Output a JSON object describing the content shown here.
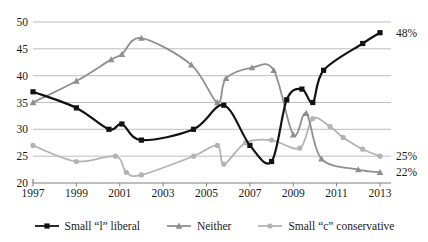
{
  "chart_data": {
    "type": "line",
    "title": "",
    "grid": true,
    "legend_position": "bottom",
    "background": "#ffffff",
    "text_color": "#1a1a1a",
    "grid_color": "#bdbdbd",
    "axis_color": "#7f7f7f",
    "x_axis": {
      "range": [
        1997,
        2013.5
      ],
      "ticks": [
        1997,
        1999,
        2001,
        2003,
        2005,
        2007,
        2009,
        2011,
        2013
      ]
    },
    "y_axis": {
      "range": [
        20,
        50
      ],
      "ticks": [
        20,
        25,
        30,
        35,
        40,
        45,
        50
      ]
    },
    "series": [
      {
        "name": "Small “c” conservative",
        "marker": "circle",
        "color": "#b3b3b3",
        "end_label": "25%",
        "points": [
          [
            1997,
            27
          ],
          [
            1999,
            24
          ],
          [
            2000.8,
            25
          ],
          [
            2001.3,
            22
          ],
          [
            2002,
            21.5
          ],
          [
            2004.4,
            25
          ],
          [
            2005.5,
            27
          ],
          [
            2005.8,
            23.5
          ],
          [
            2006.8,
            27.5
          ],
          [
            2008,
            28
          ],
          [
            2009.3,
            26.5
          ],
          [
            2009.9,
            32
          ],
          [
            2010.7,
            30.5
          ],
          [
            2011.3,
            28.5
          ],
          [
            2012.2,
            26.3
          ],
          [
            2013,
            25
          ]
        ]
      },
      {
        "name": "Neither",
        "marker": "triangle",
        "color": "#8f8f8f",
        "end_label": "22%",
        "points": [
          [
            1997,
            35
          ],
          [
            1999,
            39
          ],
          [
            2000.6,
            43
          ],
          [
            2001.1,
            44
          ],
          [
            2002,
            47
          ],
          [
            2004.3,
            42
          ],
          [
            2005.5,
            35
          ],
          [
            2005.9,
            39.5
          ],
          [
            2007.1,
            41.5
          ],
          [
            2008.1,
            41
          ],
          [
            2009,
            29
          ],
          [
            2009.6,
            33
          ],
          [
            2010.3,
            24.5
          ],
          [
            2012,
            22.5
          ],
          [
            2013,
            22
          ]
        ]
      },
      {
        "name": "Small “l” liberal",
        "marker": "square",
        "color": "#121212",
        "end_label": "48%",
        "points": [
          [
            1997,
            37
          ],
          [
            1999,
            34
          ],
          [
            2000.5,
            30
          ],
          [
            2001.1,
            31
          ],
          [
            2002,
            28
          ],
          [
            2004.4,
            30
          ],
          [
            2005.8,
            34.5
          ],
          [
            2007,
            27
          ],
          [
            2008,
            24
          ],
          [
            2008.7,
            35.5
          ],
          [
            2009.4,
            37.5
          ],
          [
            2009.9,
            35
          ],
          [
            2010.4,
            41
          ],
          [
            2012.2,
            46
          ],
          [
            2013,
            48
          ]
        ]
      }
    ],
    "legend_order": [
      "Small “l” liberal",
      "Neither",
      "Small “c” conservative"
    ]
  }
}
